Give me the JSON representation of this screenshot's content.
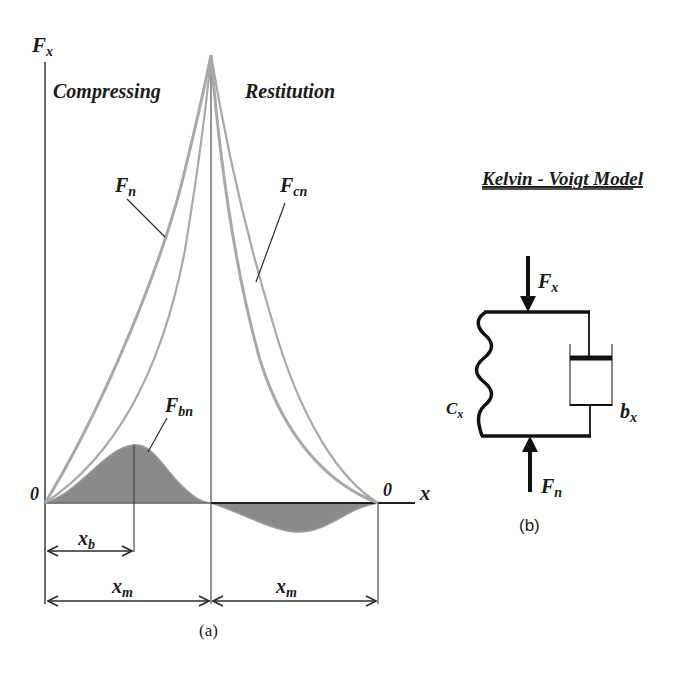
{
  "panel_a": {
    "caption": "(a)",
    "y_axis_label": {
      "main": "F",
      "sub": "x"
    },
    "x_axis_label": "x",
    "origin_left": "0",
    "origin_right": "0",
    "phase_labels": {
      "left": "Compressing",
      "right": "Restitution"
    },
    "curves": [
      {
        "id": "Fn",
        "main": "F",
        "sub": "n",
        "description": "outer loading curve (compression)"
      },
      {
        "id": "Fcn",
        "main": "F",
        "sub": "cn",
        "description": "outer unloading curve (restitution)"
      },
      {
        "id": "Fbn",
        "main": "F",
        "sub": "bn",
        "description": "damping force, shaded lobe positive during compression, negative during restitution"
      }
    ],
    "dimensions": [
      {
        "main": "x",
        "sub": "b",
        "span": "0 to peak of Fbn"
      },
      {
        "main": "x",
        "sub": "m",
        "span": "compression distance"
      },
      {
        "main": "x",
        "sub": "m",
        "span": "restitution distance"
      }
    ],
    "colors": {
      "curve": "#a8a8a8",
      "fill": "#8a8a8a",
      "axis": "#2a2a2a"
    }
  },
  "panel_b": {
    "title": "Kelvin - Voigt Model",
    "caption": "(b)",
    "top_force": {
      "main": "F",
      "sub": "x"
    },
    "bottom_force": {
      "main": "F",
      "sub": "n"
    },
    "spring_label": {
      "main": "C",
      "sub": "x"
    },
    "damper_label": {
      "main": "b",
      "sub": "x"
    }
  }
}
